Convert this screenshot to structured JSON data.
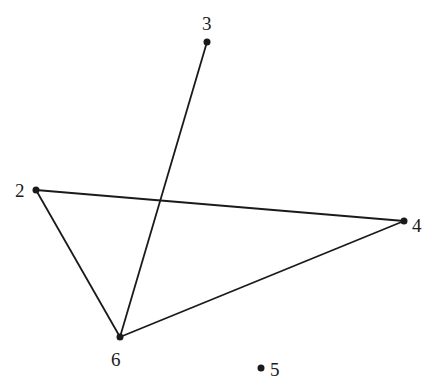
{
  "diagram": {
    "type": "graph",
    "nodes": [
      {
        "id": "3",
        "label": "3",
        "x": 207,
        "y": 42
      },
      {
        "id": "2",
        "label": "2",
        "x": 36,
        "y": 190
      },
      {
        "id": "4",
        "label": "4",
        "x": 404,
        "y": 221
      },
      {
        "id": "6",
        "label": "6",
        "x": 120,
        "y": 337
      },
      {
        "id": "5",
        "label": "5",
        "x": 261,
        "y": 368
      }
    ],
    "edges": [
      {
        "from": "3",
        "to": "6"
      },
      {
        "from": "2",
        "to": "4"
      },
      {
        "from": "2",
        "to": "6"
      },
      {
        "from": "6",
        "to": "4"
      }
    ],
    "colors": {
      "stroke": "#1a1a1a",
      "background": "#ffffff"
    }
  }
}
